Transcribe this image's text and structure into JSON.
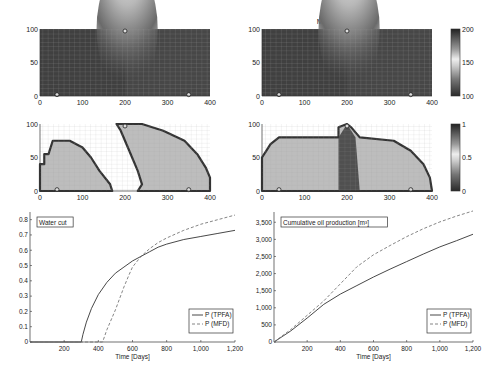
{
  "chart_data": [
    {
      "type": "heatmap",
      "id": "pressure_tpfa",
      "title": "TPFA: 500 days",
      "xlim": [
        0,
        400
      ],
      "ylim": [
        0,
        100
      ],
      "xticks": [
        "0",
        "100",
        "200",
        "300",
        "400"
      ],
      "yticks": [
        "0",
        "50",
        "100"
      ],
      "colorbar": false,
      "wells": [
        {
          "x": 200,
          "y": 97,
          "type": "injector"
        },
        {
          "x": 40,
          "y": 2,
          "type": "producer"
        },
        {
          "x": 350,
          "y": 2,
          "type": "producer"
        }
      ]
    },
    {
      "type": "heatmap",
      "id": "pressure_mimetic",
      "title": "Mimetic: 500 days",
      "xlim": [
        0,
        400
      ],
      "ylim": [
        0,
        100
      ],
      "xticks": [
        "0",
        "100",
        "200",
        "300",
        "400"
      ],
      "yticks": [
        "0",
        "50",
        "100"
      ],
      "colorbar": true,
      "colorbar_ticks": [
        "100",
        "150",
        "200"
      ],
      "wells": [
        {
          "x": 200,
          "y": 97,
          "type": "injector"
        },
        {
          "x": 40,
          "y": 2,
          "type": "producer"
        },
        {
          "x": 350,
          "y": 2,
          "type": "producer"
        }
      ]
    },
    {
      "type": "heatmap",
      "id": "saturation_tpfa",
      "title": "",
      "xlim": [
        0,
        400
      ],
      "ylim": [
        0,
        100
      ],
      "xticks": [
        "0",
        "100",
        "200",
        "300",
        "400"
      ],
      "yticks": [
        "0",
        "50",
        "100"
      ],
      "colorbar": false
    },
    {
      "type": "heatmap",
      "id": "saturation_mimetic",
      "title": "",
      "xlim": [
        0,
        400
      ],
      "ylim": [
        0,
        100
      ],
      "xticks": [
        "0",
        "100",
        "200",
        "300",
        "400"
      ],
      "yticks": [
        "0",
        "50",
        "100"
      ],
      "colorbar": true,
      "colorbar_ticks": [
        "0",
        "0.5",
        "1"
      ]
    },
    {
      "type": "line",
      "id": "water_cut",
      "title": "Water cut",
      "xlabel": "Time [Days]",
      "ylabel": "",
      "xlim": [
        0,
        1200
      ],
      "ylim": [
        0,
        0.85
      ],
      "xticks": [
        "200",
        "400",
        "600",
        "800",
        "1,000",
        "1,200"
      ],
      "yticks": [
        "0",
        "0.1",
        "0.2",
        "0.3",
        "0.4",
        "0.5",
        "0.6",
        "0.7",
        "0.8"
      ],
      "legend_position": "lower right",
      "series": [
        {
          "name": "P (TPFA)",
          "style": "solid",
          "x": [
            0,
            300,
            310,
            330,
            360,
            400,
            450,
            500,
            550,
            600,
            650,
            700,
            750,
            800,
            900,
            1000,
            1100,
            1200
          ],
          "y": [
            0,
            0,
            0.05,
            0.13,
            0.22,
            0.31,
            0.39,
            0.45,
            0.49,
            0.53,
            0.56,
            0.59,
            0.62,
            0.64,
            0.67,
            0.69,
            0.71,
            0.73
          ]
        },
        {
          "name": "P (MFD)",
          "style": "dashed",
          "x": [
            0,
            425,
            450,
            500,
            550,
            580,
            600,
            650,
            700,
            750,
            800,
            900,
            1000,
            1100,
            1200
          ],
          "y": [
            0,
            0,
            0.08,
            0.21,
            0.36,
            0.44,
            0.49,
            0.56,
            0.61,
            0.65,
            0.68,
            0.73,
            0.77,
            0.8,
            0.83
          ]
        }
      ]
    },
    {
      "type": "line",
      "id": "cumulative_oil",
      "title": "Cumulative oil production [m³]",
      "xlabel": "Time [Days]",
      "ylabel": "",
      "xlim": [
        0,
        1200
      ],
      "ylim": [
        0,
        3800
      ],
      "xticks": [
        "200",
        "400",
        "600",
        "800",
        "1,000",
        "1,200"
      ],
      "yticks": [
        "0",
        "500",
        "1,000",
        "1,500",
        "2,000",
        "2,500",
        "3,000",
        "3,500"
      ],
      "legend_position": "lower right",
      "series": [
        {
          "name": "P (TPFA)",
          "style": "solid",
          "x": [
            0,
            100,
            200,
            300,
            400,
            500,
            600,
            700,
            800,
            900,
            1000,
            1100,
            1200
          ],
          "y": [
            0,
            320,
            700,
            1100,
            1400,
            1650,
            1900,
            2130,
            2350,
            2570,
            2780,
            2960,
            3150
          ]
        },
        {
          "name": "P (MFD)",
          "style": "dashed",
          "x": [
            0,
            100,
            200,
            300,
            400,
            500,
            600,
            700,
            800,
            900,
            1000,
            1100,
            1200
          ],
          "y": [
            0,
            360,
            780,
            1200,
            1700,
            2200,
            2550,
            2820,
            3080,
            3310,
            3510,
            3680,
            3830
          ]
        }
      ]
    }
  ]
}
